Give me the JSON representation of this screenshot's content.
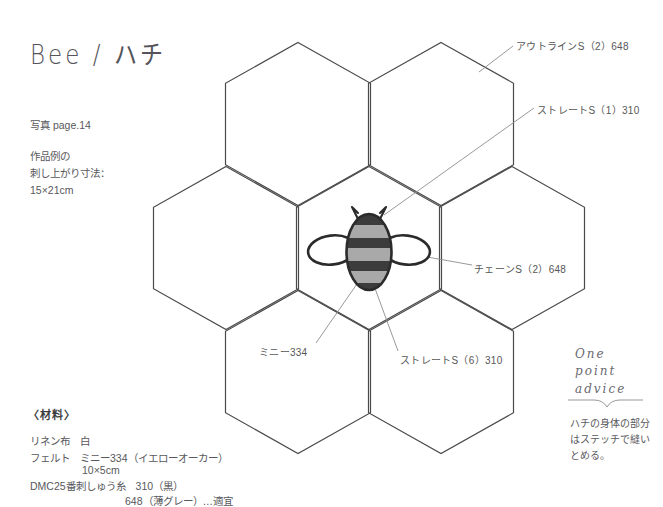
{
  "header": {
    "title": "Bee / ハチ",
    "photo_reference": "写真 page.14",
    "size_note": "作品例の\n刺し上がり寸法：\n15×21cm"
  },
  "materials": {
    "heading": "〈材料〉",
    "lines": [
      "リネン布　白",
      "フェルト　ミニー334（イエローオーカー）",
      "10×5cm",
      "DMC25番刺しゅう糸　310（黒）",
      "648（薄グレー）…適宜"
    ]
  },
  "annotations": {
    "outline_stitch": "アウトラインS（2）648",
    "straight_stitch_1": "ストレートS（1）310",
    "chain_stitch": "チェーンS（2）648",
    "mini_felt": "ミニー334",
    "straight_stitch_6": "ストレートS（6）310"
  },
  "advice": {
    "title": "One\npoint\nadvice",
    "body": "ハチの身体の部分\nはステッチで縫い\nとめる。"
  },
  "diagram": {
    "type": "embroidery-pattern",
    "motif": "bee-on-honeycomb",
    "honeycomb": {
      "cell_count": 7,
      "orientation": "pointy-top",
      "cell_width": 145,
      "cell_height": 163,
      "line_color": "#4a4a4a",
      "centers": [
        {
          "name": "top-left",
          "cx": 298,
          "cy": 124
        },
        {
          "name": "top-right",
          "cx": 441,
          "cy": 124
        },
        {
          "name": "middle-left",
          "cx": 226,
          "cy": 248
        },
        {
          "name": "center",
          "cx": 369,
          "cy": 248
        },
        {
          "name": "middle-right",
          "cx": 512,
          "cy": 248
        },
        {
          "name": "bottom-left",
          "cx": 298,
          "cy": 372
        },
        {
          "name": "bottom-right",
          "cx": 441,
          "cy": 372
        }
      ]
    },
    "bee": {
      "body_fill_light": "#a9a9a9",
      "body_fill_dark": "#3c3c3c",
      "outline_color": "#2b2b2b",
      "wing_fill": "#ffffff",
      "center_x": 369,
      "center_y": 252,
      "stripe_count": 5
    }
  }
}
